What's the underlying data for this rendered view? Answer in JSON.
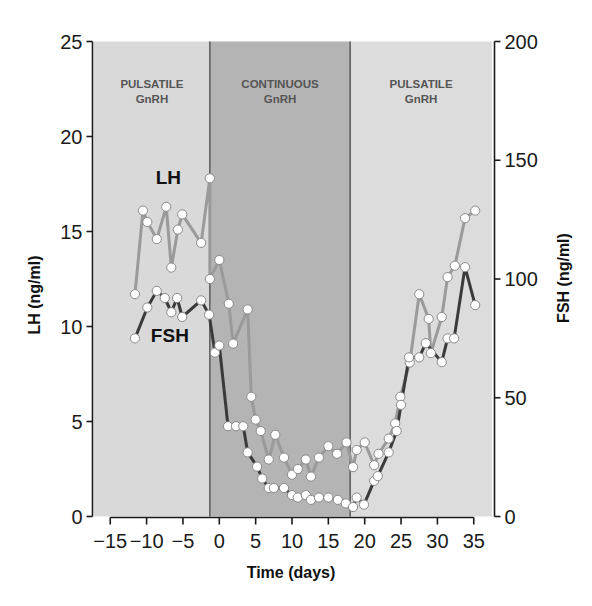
{
  "chart_data": {
    "type": "line",
    "title": "",
    "xlabel": "Time (days)",
    "ylabel": "LH (ng/ml)",
    "ylabel_right": "FSH (ng/ml)",
    "xlim": [
      -18,
      38
    ],
    "xticks": [
      -15,
      -10,
      -5,
      0,
      5,
      10,
      15,
      20,
      25,
      30,
      35
    ],
    "xtick_labels": [
      "−15",
      "−10",
      "−5",
      "0",
      "5",
      "10",
      "15",
      "20",
      "25",
      "30",
      "35"
    ],
    "ylim": [
      0,
      25
    ],
    "yticks": [
      0,
      5,
      10,
      15,
      20,
      25
    ],
    "ylim_right": [
      0,
      200
    ],
    "yticks_right": [
      0,
      50,
      100,
      150,
      200
    ],
    "grid": false,
    "legend": "inline labels",
    "regions": [
      {
        "label_line1": "PULSATILE",
        "label_line2": "GnRH",
        "x_start": -18,
        "x_end": -1.3,
        "color": "#d9d9d9"
      },
      {
        "label_line1": "CONTINUOUS",
        "label_line2": "GnRH",
        "x_start": -1.3,
        "x_end": 18,
        "color": "#b4b4b4"
      },
      {
        "label_line1": "PULSATILE",
        "label_line2": "GnRH",
        "x_start": 18,
        "x_end": 37.5,
        "color": "#dcdcdc"
      }
    ],
    "series": [
      {
        "name": "LH",
        "axis": "left",
        "color": "#9a9a9a",
        "label_pos": [
          -7.0,
          17.5
        ],
        "x": [
          -11.6,
          -10.5,
          -9.9,
          -8.6,
          -7.3,
          -6.6,
          -5.7,
          -5.1,
          -2.5,
          -1.3,
          -1.3,
          0.0,
          1.3,
          1.9,
          3.9,
          4.4,
          5.0,
          5.7,
          6.8,
          7.7,
          8.9,
          10.0,
          10.8,
          11.9,
          12.6,
          13.7,
          15.0,
          16.2,
          17.5,
          18.4,
          18.9,
          20.0,
          21.3,
          21.9,
          23.3,
          24.2,
          24.9,
          26.2,
          27.5,
          28.8,
          29.1,
          30.6,
          31.4,
          32.4,
          33.8,
          35.2
        ],
        "values": [
          11.7,
          16.1,
          15.5,
          14.6,
          16.3,
          13.1,
          15.1,
          15.9,
          14.4,
          17.8,
          12.5,
          13.5,
          11.2,
          9.1,
          10.9,
          6.3,
          5.1,
          4.5,
          3.0,
          4.3,
          3.1,
          2.2,
          2.5,
          3.0,
          2.1,
          3.1,
          3.7,
          3.3,
          3.9,
          2.6,
          3.5,
          3.9,
          2.7,
          3.3,
          4.1,
          4.9,
          6.3,
          8.1,
          11.7,
          10.4,
          8.6,
          10.5,
          12.6,
          13.2,
          15.7,
          16.1
        ]
      },
      {
        "name": "FSH",
        "axis": "right",
        "color": "#3a3a3a",
        "label_pos": [
          -6.8,
          9.2
        ],
        "x": [
          -11.6,
          -9.9,
          -8.6,
          -7.5,
          -6.6,
          -5.8,
          -5.1,
          -2.5,
          -1.4,
          -0.6,
          0.0,
          1.2,
          2.3,
          3.3,
          3.9,
          5.2,
          5.9,
          6.8,
          7.5,
          8.9,
          10.0,
          10.8,
          11.9,
          12.6,
          13.7,
          15.0,
          16.3,
          17.4,
          18.4,
          18.9,
          19.9,
          21.3,
          21.8,
          23.3,
          24.4,
          25.0,
          26.1,
          27.5,
          28.4,
          30.6,
          31.4,
          32.3,
          33.8,
          35.2
        ],
        "values": [
          75,
          88,
          95,
          92,
          86,
          92,
          84,
          91,
          85,
          69,
          72,
          38,
          38,
          38,
          27,
          21,
          16,
          12,
          12,
          12,
          9,
          8,
          9,
          7,
          8,
          8,
          7,
          5.5,
          4,
          8,
          5,
          15,
          17,
          27,
          36,
          47,
          67,
          67,
          73,
          65,
          75,
          75,
          105,
          89
        ]
      }
    ]
  },
  "labels": {
    "xlabel": "Time (days)",
    "ylabel_left": "LH (ng/ml)",
    "ylabel_right": "FSH (ng/ml)",
    "series_lh": "LH",
    "series_fsh": "FSH"
  }
}
